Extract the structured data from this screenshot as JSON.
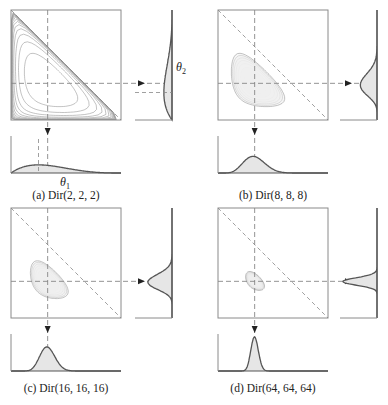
{
  "figure": {
    "panels": [
      {
        "id": "a",
        "caption": "(a) Dir(2, 2, 2)",
        "alpha": [
          2,
          2,
          2
        ],
        "x_label": "θ",
        "x_label_sub": "1",
        "y_label": "θ",
        "y_label_sub": "2"
      },
      {
        "id": "b",
        "caption": "(b) Dir(8, 8, 8)",
        "alpha": [
          8,
          8,
          8
        ]
      },
      {
        "id": "c",
        "caption": "(c) Dir(16, 16, 16)",
        "alpha": [
          16,
          16,
          16
        ]
      },
      {
        "id": "d",
        "caption": "(d) Dir(64, 64, 64)",
        "alpha": [
          64,
          64,
          64
        ]
      }
    ],
    "colors": {
      "frame": "#8a8a8a",
      "contour": "#9a9a9a",
      "dashed": "#888888",
      "curve": "#555555",
      "fill": "#e6e6e6"
    }
  },
  "chart_data": [
    {
      "type": "contour",
      "title": "(a) Dir(2, 2, 2)",
      "xlabel": "θ1",
      "ylabel": "θ2",
      "xlim": [
        0,
        1
      ],
      "ylim": [
        0,
        1
      ],
      "alpha": [
        2,
        2,
        2
      ],
      "mode": [
        0.25,
        0.25
      ],
      "mean": [
        0.333,
        0.333
      ],
      "marginal": "Beta(2, 4)",
      "notes": "Density over simplex θ1+θ2≤1; wide contours filling triangle; dashed diagonal θ1+θ2=1"
    },
    {
      "type": "contour",
      "title": "(b) Dir(8, 8, 8)",
      "xlabel": "θ1",
      "ylabel": "θ2",
      "xlim": [
        0,
        1
      ],
      "ylim": [
        0,
        1
      ],
      "alpha": [
        8,
        8,
        8
      ],
      "mode": [
        0.333,
        0.333
      ],
      "marginal": "Beta(8, 16)"
    },
    {
      "type": "contour",
      "title": "(c) Dir(16, 16, 16)",
      "xlabel": "θ1",
      "ylabel": "θ2",
      "xlim": [
        0,
        1
      ],
      "ylim": [
        0,
        1
      ],
      "alpha": [
        16,
        16,
        16
      ],
      "mode": [
        0.333,
        0.333
      ],
      "marginal": "Beta(16, 32)"
    },
    {
      "type": "contour",
      "title": "(d) Dir(64, 64, 64)",
      "xlabel": "θ1",
      "ylabel": "θ2",
      "xlim": [
        0,
        1
      ],
      "ylim": [
        0,
        1
      ],
      "alpha": [
        64,
        64,
        64
      ],
      "mode": [
        0.333,
        0.333
      ],
      "marginal": "Beta(64, 128)"
    }
  ]
}
